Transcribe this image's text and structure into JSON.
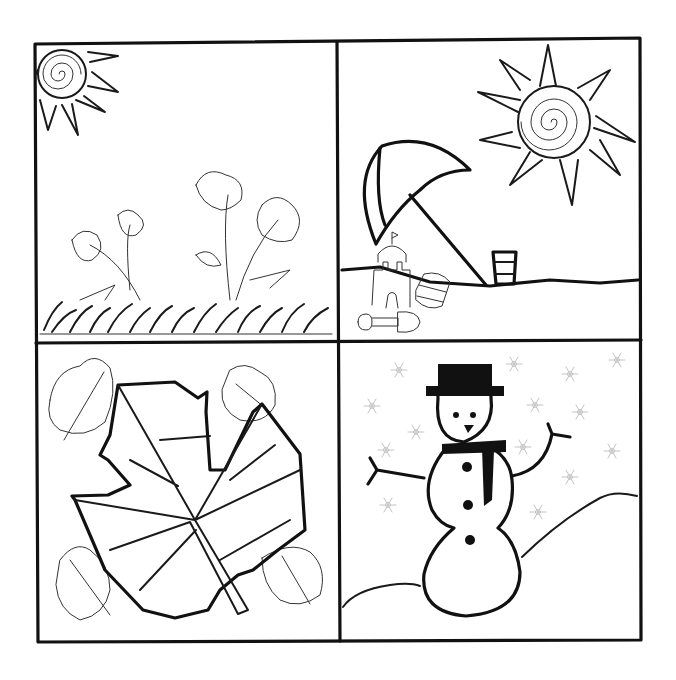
{
  "colors": {
    "ink": "#111111",
    "paper": "#ffffff",
    "snowflake": "#c4c4c4"
  },
  "panels": [
    {
      "season": "spring",
      "elements": [
        "sun-spiral",
        "flowers",
        "grass"
      ]
    },
    {
      "season": "summer",
      "elements": [
        "sun-spiral",
        "beach-umbrella",
        "sand-castle",
        "bucket",
        "pail",
        "shovel",
        "beach"
      ]
    },
    {
      "season": "autumn",
      "elements": [
        "large-leaf",
        "small-leaves"
      ]
    },
    {
      "season": "winter",
      "elements": [
        "snowman",
        "top-hat",
        "scarf",
        "snowflakes",
        "snow-hills"
      ]
    }
  ]
}
